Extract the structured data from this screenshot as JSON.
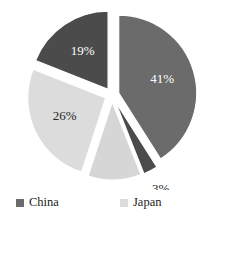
{
  "chart_data": {
    "type": "pie",
    "title": "",
    "subtitle": "",
    "xlabel": "",
    "ylabel": "",
    "grid": false,
    "exploded": true,
    "start_angle_deg": 0,
    "direction": "clockwise",
    "legend_position": "bottom",
    "legend_columns": 2,
    "categories": [
      "China",
      "Germany",
      "Other countries",
      "Japan",
      "United States"
    ],
    "values": [
      41,
      3,
      11,
      26,
      19
    ],
    "value_suffix": "%",
    "slices": [
      {
        "name": "China",
        "value": 41,
        "label": "41%",
        "color": "#6b6b6b",
        "label_color": "#ffffff",
        "label_placement": "inside"
      },
      {
        "name": "Germany",
        "value": 3,
        "label": "3%",
        "color": "#4b4b4b",
        "label_color": "#262626",
        "label_placement": "outside"
      },
      {
        "name": "Other countries",
        "value": 11,
        "label": "11%",
        "color": "#d6d6d6",
        "label_color": "#262626",
        "label_placement": "outside"
      },
      {
        "name": "Japan",
        "value": 26,
        "label": "26%",
        "color": "#dcdcdc",
        "label_color": "#262626",
        "label_placement": "inside"
      },
      {
        "name": "United States",
        "value": 19,
        "label": "19%",
        "color": "#4b4b4b",
        "label_color": "#ffffff",
        "label_placement": "inside"
      }
    ]
  },
  "legend": {
    "items": [
      {
        "label": "China",
        "color": "#6b6b6b"
      },
      {
        "label": "Japan",
        "color": "#dcdcdc"
      },
      {
        "label": "United States",
        "color": "#4b4b4b"
      },
      {
        "label": "Germany",
        "color": "#4b4b4b"
      },
      {
        "label": "Other countries",
        "color": "#d6d6d6"
      }
    ]
  }
}
